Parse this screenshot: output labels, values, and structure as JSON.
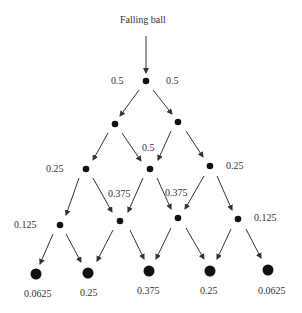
{
  "title": "Falling ball",
  "colors": {
    "ball": "#111111",
    "arrow": "#333333",
    "text": "#333333"
  },
  "labels": {
    "l1_left": "0.5",
    "l1_right": "0.5",
    "l2_center": "0.5",
    "l3_left": "0.25",
    "l3_right": "0.25",
    "l3_mid_left": "0.375",
    "l3_mid_right": "0.375",
    "l4_left": "0.125",
    "l4_right": "0.125",
    "bottom": [
      "0.0625",
      "0.25",
      "0.375",
      "0.25",
      "0.0625"
    ]
  }
}
